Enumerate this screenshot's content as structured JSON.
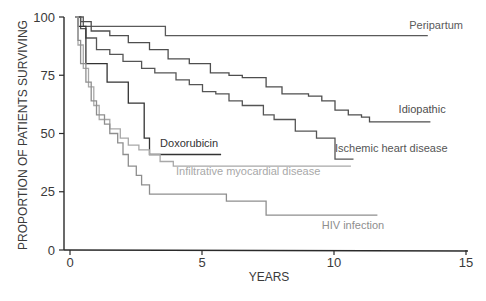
{
  "chart_data": {
    "type": "line",
    "subtype": "kaplan-meier step",
    "title": "",
    "xlabel": "YEARS",
    "ylabel": "PROPORTION OF PATIENTS SURVIVING",
    "xlim": [
      0,
      15
    ],
    "ylim": [
      0,
      100
    ],
    "xticks": [
      0,
      5,
      10,
      15
    ],
    "yticks": [
      0,
      25,
      50,
      75,
      100
    ],
    "grid": false,
    "legend": "inline labels at curve ends",
    "series": [
      {
        "name": "Peripartum",
        "color": "#5a5a5a",
        "points": [
          [
            0.2,
            100
          ],
          [
            0.5,
            100
          ],
          [
            0.5,
            96
          ],
          [
            3.6,
            96
          ],
          [
            3.6,
            92
          ],
          [
            13.5,
            92
          ],
          [
            13.5,
            92
          ]
        ],
        "label_pos": [
          12.8,
          95
        ]
      },
      {
        "name": "Idiopathic",
        "color": "#4e4e4e",
        "points": [
          [
            0.2,
            100
          ],
          [
            0.4,
            98
          ],
          [
            0.8,
            94
          ],
          [
            1.5,
            92
          ],
          [
            2.2,
            89
          ],
          [
            3.0,
            86
          ],
          [
            3.7,
            82
          ],
          [
            4.5,
            80
          ],
          [
            5.3,
            76
          ],
          [
            6.0,
            75
          ],
          [
            6.5,
            74
          ],
          [
            7.4,
            70
          ],
          [
            8.0,
            67
          ],
          [
            9.0,
            66
          ],
          [
            9.5,
            64
          ],
          [
            10.0,
            60
          ],
          [
            10.5,
            58
          ],
          [
            11.0,
            57
          ],
          [
            11.3,
            55
          ],
          [
            13.6,
            55
          ]
        ],
        "label_pos": [
          12.4,
          59
        ]
      },
      {
        "name": "Ischemic heart disease",
        "color": "#555555",
        "points": [
          [
            0.2,
            100
          ],
          [
            0.4,
            95
          ],
          [
            0.6,
            91
          ],
          [
            1.0,
            86
          ],
          [
            1.5,
            84
          ],
          [
            2.0,
            81
          ],
          [
            2.7,
            78
          ],
          [
            3.2,
            76
          ],
          [
            4.0,
            73
          ],
          [
            4.5,
            71
          ],
          [
            5.0,
            68
          ],
          [
            5.5,
            67
          ],
          [
            6.0,
            64
          ],
          [
            6.5,
            62
          ],
          [
            7.3,
            58
          ],
          [
            7.7,
            56
          ],
          [
            8.5,
            51
          ],
          [
            9.3,
            48
          ],
          [
            10.0,
            44
          ],
          [
            10.0,
            39
          ],
          [
            10.7,
            39
          ]
        ],
        "label_pos": [
          10.0,
          42
        ]
      },
      {
        "name": "Doxorubicin",
        "color": "#333333",
        "points": [
          [
            0.3,
            100
          ],
          [
            0.3,
            96
          ],
          [
            0.6,
            96
          ],
          [
            0.6,
            80
          ],
          [
            1.4,
            80
          ],
          [
            1.4,
            72
          ],
          [
            2.2,
            72
          ],
          [
            2.2,
            63
          ],
          [
            2.8,
            63
          ],
          [
            2.8,
            48
          ],
          [
            3.0,
            48
          ],
          [
            3.0,
            41
          ],
          [
            5.7,
            41
          ]
        ],
        "label_pos": [
          3.4,
          44
        ]
      },
      {
        "name": "Infiltrative myocardial disease",
        "color": "#a8a8a8",
        "points": [
          [
            0.2,
            100
          ],
          [
            0.3,
            88
          ],
          [
            0.5,
            78
          ],
          [
            0.7,
            70
          ],
          [
            0.9,
            62
          ],
          [
            1.1,
            56
          ],
          [
            1.5,
            52
          ],
          [
            1.9,
            48
          ],
          [
            2.2,
            45
          ],
          [
            2.6,
            43
          ],
          [
            3.0,
            41
          ],
          [
            3.4,
            38
          ],
          [
            3.9,
            36
          ],
          [
            10.6,
            36
          ]
        ],
        "label_pos": [
          4.0,
          32
        ]
      },
      {
        "name": "HIV infection",
        "color": "#8e8e8e",
        "points": [
          [
            0.2,
            100
          ],
          [
            0.3,
            90
          ],
          [
            0.4,
            80
          ],
          [
            0.6,
            72
          ],
          [
            0.8,
            64
          ],
          [
            1.0,
            58
          ],
          [
            1.3,
            54
          ],
          [
            1.5,
            50
          ],
          [
            1.8,
            46
          ],
          [
            2.0,
            41
          ],
          [
            2.2,
            36
          ],
          [
            2.5,
            32
          ],
          [
            2.7,
            28
          ],
          [
            3.0,
            24
          ],
          [
            5.9,
            24
          ],
          [
            5.9,
            21
          ],
          [
            7.4,
            21
          ],
          [
            7.4,
            15
          ],
          [
            11.6,
            15
          ]
        ],
        "label_pos": [
          9.5,
          9
        ]
      }
    ]
  },
  "axes": {
    "y_title": "PROPORTION OF PATIENTS SURVIVING",
    "x_title": "YEARS",
    "y_ticks": [
      "0",
      "25",
      "50",
      "75",
      "100"
    ],
    "x_ticks": [
      "0",
      "5",
      "10",
      "15"
    ]
  }
}
